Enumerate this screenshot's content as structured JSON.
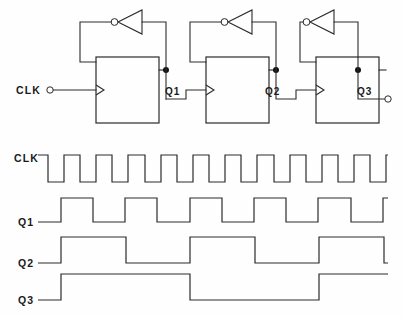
{
  "figure": {
    "kind": "digital-logic-schematic-with-timing-diagram",
    "ink_color": "#2a2a2a",
    "background_color": "#ffffff"
  },
  "schematic": {
    "input_label": "CLK",
    "stages": [
      {
        "index": 1,
        "output_label": "Q1"
      },
      {
        "index": 2,
        "output_label": "Q2"
      },
      {
        "index": 3,
        "output_label": "Q3"
      }
    ],
    "flipflop_count": 3,
    "inverter_count": 3,
    "node_dot_count": 3,
    "terminal_count": 2,
    "clock_edge_marker": "triangle"
  },
  "timing": {
    "labels": [
      "CLK",
      "Q1",
      "Q2",
      "Q3"
    ],
    "clk_label": "CLK",
    "q1_label": "Q1",
    "q2_label": "Q2",
    "q3_label": "Q3"
  },
  "chart_data": {
    "type": "line",
    "title": "",
    "xlabel": "",
    "ylabel": "",
    "grid": false,
    "legend": "none",
    "x_start": 38,
    "x_end": 388,
    "note": "Asynchronous ripple (divide-by-2) counter waveforms. Each trace is a square wave; values are digital levels 0/1 sampled as transition points in pixel-x coordinates.",
    "series": [
      {
        "name": "CLK",
        "row_label": "CLK",
        "baseline_y": 182,
        "high_y": 155,
        "start_level": 1,
        "period_px": 32.2,
        "duty": 0.5,
        "cycles": 11,
        "transitions": [
          38,
          48,
          64,
          80,
          96,
          112,
          128,
          145,
          161,
          177,
          193,
          209,
          225,
          241,
          257,
          274,
          290,
          306,
          322,
          338,
          354,
          370,
          386,
          388
        ]
      },
      {
        "name": "Q1",
        "row_label": "Q1",
        "baseline_y": 222,
        "high_y": 198,
        "start_level": 0,
        "period_px": 64.5,
        "duty": 0.5,
        "cycles": 6,
        "transitions": [
          38,
          61,
          93,
          125,
          157,
          190,
          222,
          254,
          286,
          318,
          351,
          383,
          388
        ]
      },
      {
        "name": "Q2",
        "row_label": "Q2",
        "baseline_y": 263,
        "high_y": 237,
        "start_level": 0,
        "period_px": 129,
        "duty": 0.5,
        "cycles": 3,
        "transitions": [
          38,
          61,
          126,
          190,
          255,
          319,
          384,
          388
        ]
      },
      {
        "name": "Q3",
        "row_label": "Q3",
        "baseline_y": 300,
        "high_y": 274,
        "start_level": 0,
        "period_px": 258,
        "duty": 0.5,
        "cycles": 1.5,
        "transitions": [
          38,
          61,
          190,
          319,
          388
        ]
      }
    ]
  }
}
